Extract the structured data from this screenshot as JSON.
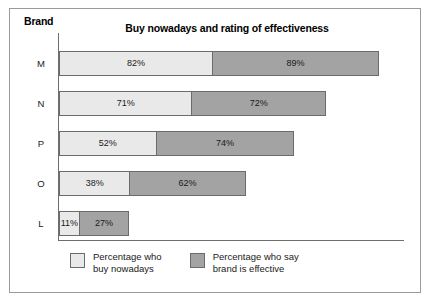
{
  "chart_data": {
    "type": "bar",
    "subtype": "stacked-horizontal",
    "title": "Buy nowadays and rating of effectiveness",
    "xlabel": "",
    "ylabel": "Brand",
    "categories": [
      "M",
      "N",
      "P",
      "O",
      "L"
    ],
    "series": [
      {
        "name": "Percentage who buy nowadays",
        "color": "#e9e9e9",
        "values": [
          82,
          71,
          52,
          38,
          11
        ],
        "labels": [
          "82%",
          "71%",
          "52%",
          "38%",
          "11%"
        ]
      },
      {
        "name": "Percentage who say brand is effective",
        "color": "#a3a3a3",
        "values": [
          89,
          72,
          74,
          62,
          27
        ],
        "labels": [
          "89%",
          "72%",
          "74%",
          "62%",
          "27%"
        ]
      }
    ],
    "totals": [
      171,
      143,
      126,
      100,
      38
    ],
    "xlim": [
      0,
      185
    ],
    "grid": false,
    "legend_position": "bottom",
    "px_per_unit": 1.877
  },
  "axis": {
    "brand_label": "Brand"
  },
  "legend": {
    "items": [
      {
        "label": "Percentage who\nbuy nowadays",
        "swatch": "light"
      },
      {
        "label": "Percentage who say\nbrand is effective",
        "swatch": "dark"
      }
    ]
  }
}
